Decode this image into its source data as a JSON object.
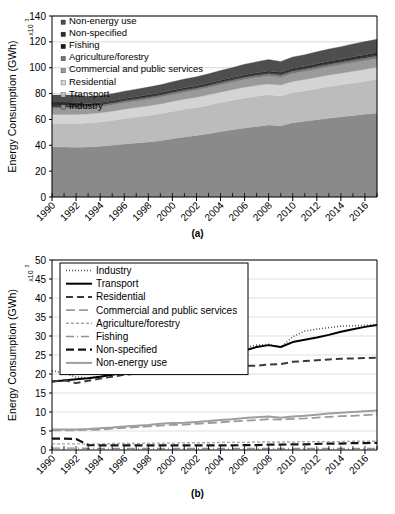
{
  "figure": {
    "caption_a": "(a)",
    "caption_b": "(b)"
  },
  "chart_data": [
    {
      "id": "chart-a",
      "type": "area",
      "title": "",
      "xlabel": "",
      "ylabel": "Energy Consumption (GWh)",
      "y_exponent": "x10",
      "y_exponent_sup": "3",
      "ylim": [
        0,
        140
      ],
      "yticks": [
        0,
        20,
        40,
        60,
        80,
        100,
        120,
        140
      ],
      "xlim": [
        1990,
        2017
      ],
      "xticks": [
        1990,
        1992,
        1994,
        1996,
        1998,
        2000,
        2002,
        2004,
        2006,
        2008,
        2010,
        2012,
        2014,
        2016
      ],
      "xtick_labels": [
        "1990",
        "1992",
        "1994",
        "1996",
        "1998",
        "2000",
        "2002",
        "2004",
        "2006",
        "2008",
        "2010",
        "2012",
        "2014",
        "2016"
      ],
      "grid": "horizontal",
      "stacked": true,
      "legend_position": "top-left-inside",
      "legend_order_top_to_bottom": [
        "Non-energy use",
        "Non-specified",
        "Fishing",
        "Agriculture/forestry",
        "Commercial and public services",
        "Residential",
        "Transport",
        "Industry"
      ],
      "x": [
        1990,
        1991,
        1992,
        1993,
        1994,
        1995,
        1996,
        1997,
        1998,
        1999,
        2000,
        2001,
        2002,
        2003,
        2004,
        2005,
        2006,
        2007,
        2008,
        2009,
        2010,
        2011,
        2012,
        2013,
        2014,
        2015,
        2016,
        2017
      ],
      "series": [
        {
          "name": "Industry",
          "color": "#8a8a8a",
          "values": [
            38.8,
            38.6,
            38.4,
            38.6,
            39.2,
            40.0,
            41.0,
            41.8,
            42.6,
            43.6,
            45.0,
            46.4,
            47.6,
            49.0,
            50.6,
            52.0,
            53.4,
            54.6,
            55.6,
            55.2,
            57.4,
            58.6,
            59.8,
            61.0,
            62.0,
            63.0,
            64.0,
            65.0
          ]
        },
        {
          "name": "Transport",
          "color": "#bcbcbc",
          "values": [
            18.0,
            18.2,
            18.4,
            18.6,
            18.8,
            19.2,
            19.6,
            20.0,
            20.4,
            20.8,
            21.2,
            21.4,
            21.6,
            22.0,
            22.4,
            22.8,
            23.2,
            23.4,
            23.4,
            23.0,
            23.4,
            23.6,
            24.0,
            24.4,
            24.8,
            25.2,
            25.6,
            26.0
          ]
        },
        {
          "name": "Residential",
          "color": "#d4d4d4",
          "values": [
            7.0,
            7.0,
            7.0,
            7.0,
            7.1,
            7.2,
            7.3,
            7.4,
            7.5,
            7.6,
            7.7,
            7.8,
            7.9,
            8.0,
            8.1,
            8.2,
            8.3,
            8.4,
            8.5,
            8.4,
            8.6,
            8.7,
            8.8,
            8.9,
            9.0,
            9.1,
            9.2,
            9.3
          ]
        },
        {
          "name": "Commercial and public services",
          "color": "#9a9a9a",
          "values": [
            4.6,
            4.6,
            4.6,
            4.7,
            4.8,
            4.9,
            5.0,
            5.1,
            5.2,
            5.3,
            5.4,
            5.5,
            5.6,
            5.7,
            5.8,
            5.9,
            6.0,
            6.1,
            6.2,
            6.1,
            6.2,
            6.3,
            6.4,
            6.5,
            6.6,
            6.7,
            6.8,
            6.9
          ]
        },
        {
          "name": "Agriculture/forestry",
          "color": "#787878",
          "values": [
            1.6,
            1.6,
            1.6,
            1.6,
            1.6,
            1.6,
            1.7,
            1.7,
            1.7,
            1.7,
            1.8,
            1.8,
            1.8,
            1.8,
            1.9,
            1.9,
            1.9,
            1.9,
            2.0,
            2.0,
            2.0,
            2.0,
            2.1,
            2.1,
            2.1,
            2.2,
            2.2,
            2.2
          ]
        },
        {
          "name": "Fishing",
          "color": "#1c1c1c",
          "values": [
            0.5,
            0.5,
            0.5,
            0.4,
            0.4,
            0.4,
            0.4,
            0.4,
            0.4,
            0.4,
            0.4,
            0.4,
            0.4,
            0.4,
            0.4,
            0.4,
            0.4,
            0.4,
            0.4,
            0.4,
            0.4,
            0.4,
            0.4,
            0.4,
            0.4,
            0.4,
            0.4,
            0.4
          ]
        },
        {
          "name": "Non-specified",
          "color": "#2e2e2e",
          "values": [
            3.0,
            2.9,
            2.8,
            1.3,
            1.2,
            1.2,
            1.2,
            1.2,
            1.2,
            1.2,
            1.2,
            1.2,
            1.2,
            1.2,
            1.2,
            1.2,
            1.3,
            1.3,
            1.4,
            1.4,
            1.5,
            1.5,
            1.6,
            1.7,
            1.7,
            1.8,
            1.8,
            1.9
          ]
        },
        {
          "name": "Non-energy use",
          "color": "#4e4e4e",
          "values": [
            5.3,
            5.4,
            5.5,
            5.6,
            5.3,
            5.4,
            5.6,
            5.8,
            6.0,
            6.2,
            6.5,
            6.7,
            6.9,
            7.2,
            7.5,
            7.8,
            8.2,
            8.5,
            8.8,
            8.4,
            8.8,
            9.0,
            9.2,
            9.5,
            9.7,
            10.0,
            10.2,
            10.4
          ]
        }
      ]
    },
    {
      "id": "chart-b",
      "type": "line",
      "title": "",
      "xlabel": "",
      "ylabel": "Energy Consumption (GWh)",
      "y_exponent": "x10",
      "y_exponent_sup": "3",
      "ylim": [
        0,
        50
      ],
      "yticks": [
        0,
        5,
        10,
        15,
        20,
        25,
        30,
        35,
        40,
        45,
        50
      ],
      "xlim": [
        1990,
        2017
      ],
      "xticks": [
        1990,
        1992,
        1994,
        1996,
        1998,
        2000,
        2002,
        2004,
        2006,
        2008,
        2010,
        2012,
        2014,
        2016
      ],
      "xtick_labels": [
        "1990",
        "1992",
        "1994",
        "1996",
        "1998",
        "2000",
        "2002",
        "2004",
        "2006",
        "2008",
        "2010",
        "2012",
        "2014",
        "2016"
      ],
      "grid": "horizontal",
      "legend_position": "top-left-inside",
      "x": [
        1990,
        1991,
        1992,
        1993,
        1994,
        1995,
        1996,
        1997,
        1998,
        1999,
        2000,
        2001,
        2002,
        2003,
        2004,
        2005,
        2006,
        2007,
        2008,
        2009,
        2010,
        2011,
        2012,
        2013,
        2014,
        2015,
        2016,
        2017
      ],
      "series": [
        {
          "name": "Industry",
          "color": "#555555",
          "dash": "1,2",
          "width": 1.6,
          "values": [
            20.9,
            20.2,
            19.2,
            19.0,
            19.4,
            19.8,
            20.3,
            20.7,
            20.9,
            21.3,
            21.7,
            21.5,
            21.8,
            22.6,
            24.4,
            25.8,
            27.0,
            27.6,
            27.8,
            27.0,
            29.8,
            31.3,
            31.8,
            32.2,
            32.6,
            32.7,
            32.8,
            32.9
          ]
        },
        {
          "name": "Transport",
          "color": "#000000",
          "dash": "none",
          "width": 2.0,
          "values": [
            18.0,
            18.3,
            18.6,
            18.9,
            19.3,
            19.8,
            20.4,
            20.9,
            21.3,
            21.8,
            22.3,
            22.6,
            23.0,
            23.6,
            24.4,
            25.3,
            26.2,
            27.1,
            27.6,
            27.1,
            28.4,
            29.0,
            29.6,
            30.3,
            31.1,
            31.8,
            32.4,
            32.9
          ]
        },
        {
          "name": "Residential",
          "color": "#3a3a3a",
          "dash": "7,4",
          "width": 2.0,
          "values": [
            18.0,
            18.4,
            17.6,
            18.2,
            18.8,
            19.3,
            19.8,
            20.1,
            20.3,
            20.8,
            21.4,
            21.3,
            21.2,
            21.5,
            21.8,
            21.9,
            22.2,
            22.2,
            22.5,
            22.6,
            23.2,
            23.4,
            23.6,
            23.8,
            24.0,
            24.1,
            24.2,
            24.3
          ]
        },
        {
          "name": "Commercial and public services",
          "color": "#9a9a9a",
          "dash": "9,4",
          "width": 1.8,
          "values": [
            5.2,
            5.2,
            5.2,
            5.3,
            5.4,
            5.6,
            5.8,
            6.0,
            6.2,
            6.4,
            6.6,
            6.7,
            6.9,
            7.1,
            7.3,
            7.5,
            7.7,
            7.9,
            8.1,
            8.0,
            8.2,
            8.3,
            8.5,
            8.7,
            8.9,
            9.0,
            9.2,
            9.4
          ]
        },
        {
          "name": "Agriculture/forestry",
          "color": "#a8a8a8",
          "dash": "3,2",
          "width": 1.4,
          "values": [
            1.6,
            1.6,
            1.6,
            1.6,
            1.6,
            1.7,
            1.7,
            1.7,
            1.8,
            1.8,
            1.8,
            1.9,
            1.9,
            1.9,
            2.0,
            2.0,
            2.0,
            2.1,
            2.1,
            2.1,
            2.1,
            2.2,
            2.2,
            2.2,
            2.2,
            2.3,
            2.3,
            2.3
          ]
        },
        {
          "name": "Fishing",
          "color": "#8f8f8f",
          "dash": "8,3,1,3",
          "width": 1.4,
          "values": [
            0.5,
            0.5,
            0.5,
            0.4,
            0.4,
            0.4,
            0.4,
            0.4,
            0.4,
            0.4,
            0.4,
            0.4,
            0.4,
            0.4,
            0.4,
            0.4,
            0.4,
            0.4,
            0.4,
            0.4,
            0.4,
            0.4,
            0.4,
            0.4,
            0.4,
            0.4,
            0.4,
            0.4
          ]
        },
        {
          "name": "Non-specified",
          "color": "#151515",
          "dash": "8,4",
          "width": 2.2,
          "values": [
            3.0,
            3.0,
            2.9,
            1.3,
            1.2,
            1.2,
            1.2,
            1.2,
            1.2,
            1.2,
            1.2,
            1.2,
            1.2,
            1.2,
            1.2,
            1.2,
            1.3,
            1.3,
            1.4,
            1.4,
            1.5,
            1.5,
            1.6,
            1.7,
            1.7,
            1.8,
            1.8,
            1.9
          ]
        },
        {
          "name": "Non-energy use",
          "color": "#9e9e9e",
          "dash": "none",
          "width": 2.0,
          "values": [
            5.4,
            5.4,
            5.4,
            5.5,
            5.7,
            5.9,
            6.2,
            6.4,
            6.6,
            6.9,
            7.1,
            7.2,
            7.4,
            7.6,
            7.9,
            8.1,
            8.4,
            8.6,
            8.8,
            8.5,
            8.8,
            9.0,
            9.3,
            9.6,
            9.8,
            10.0,
            10.2,
            10.4
          ]
        }
      ]
    }
  ]
}
